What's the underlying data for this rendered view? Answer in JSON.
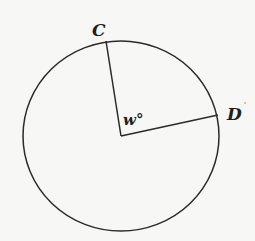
{
  "diagram": {
    "type": "circle with central angle",
    "circle": {
      "cx": 121,
      "cy": 136,
      "rx": 98,
      "ry": 95,
      "stroke": "#2a2a2a"
    },
    "center": {
      "x": 121,
      "y": 136
    },
    "points": [
      {
        "name": "C",
        "x": 106,
        "y": 41,
        "label_x": 92,
        "label_y": 36
      },
      {
        "name": "D",
        "x": 218,
        "y": 115,
        "label_x": 227,
        "label_y": 120
      }
    ],
    "angle_label": "w°",
    "angle_label_pos": {
      "x": 123,
      "y": 125
    }
  }
}
